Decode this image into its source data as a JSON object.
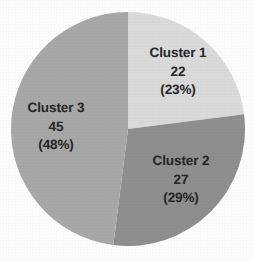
{
  "chart_data": {
    "type": "pie",
    "title": "",
    "subtitle": "",
    "xlabel": "",
    "ylabel": "",
    "legend_position": "none",
    "grid": false,
    "total": 94,
    "categories": [
      "Cluster 1",
      "Cluster 2",
      "Cluster 3"
    ],
    "values": [
      22,
      27,
      45
    ],
    "percentages": [
      23,
      29,
      48
    ],
    "percent_labels": [
      "(23%)",
      "(29%)",
      "(48%)"
    ],
    "value_labels": [
      "22",
      "27",
      "45"
    ],
    "colors": [
      "#dcdcdc",
      "#909090",
      "#a9a9a9"
    ],
    "start_angle_deg": 0,
    "direction": "clockwise",
    "slices": [
      {
        "name": "Cluster 1",
        "value": "22",
        "percent": "(23%)",
        "color": "#dcdcdc",
        "start_deg": 0,
        "end_deg": 82.8
      },
      {
        "name": "Cluster 2",
        "value": "27",
        "percent": "(29%)",
        "color": "#909090",
        "start_deg": 82.8,
        "end_deg": 187.2
      },
      {
        "name": "Cluster 3",
        "value": "45",
        "percent": "(48%)",
        "color": "#a9a9a9",
        "start_deg": 187.2,
        "end_deg": 360
      }
    ]
  },
  "canvas": {
    "background": "#ffffff",
    "label_color": "#262626"
  }
}
